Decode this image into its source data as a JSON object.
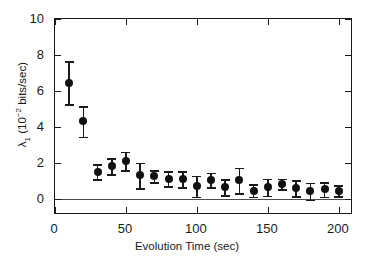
{
  "chart_data": {
    "type": "scatter",
    "title": "",
    "subtitle": "",
    "xlabel": "Evolution Time (sec)",
    "ylabel": "λ₁ (10⁻² bits/sec)",
    "ylabel_parts": {
      "symbol": "λ",
      "subscript": "1",
      "units_prefix": " (10",
      "exponent": "-2",
      "units_suffix": " bits/sec)"
    },
    "xlim": [
      0,
      210
    ],
    "ylim": [
      -0.9,
      10
    ],
    "xticks": [
      0,
      50,
      100,
      150,
      200
    ],
    "xticklabels": [
      "0",
      "50",
      "100",
      "150",
      "200"
    ],
    "yticks": [
      0,
      2,
      4,
      6,
      8,
      10
    ],
    "yticklabels": [
      "0",
      "2",
      "4",
      "6",
      "8",
      "10"
    ],
    "grid": false,
    "legend": null,
    "legend_position": "none",
    "marker": "filled-circle",
    "marker_color": "#111111",
    "errorbar_color": "#1a1a1a",
    "frame_color": "#1a1a1a",
    "background_color": "#ffffff",
    "reference_lines": [
      {
        "axis": "y",
        "value": 0,
        "color": "#4d4d4d",
        "style": "solid"
      }
    ],
    "x": [
      10,
      20,
      30,
      40,
      50,
      60,
      70,
      80,
      90,
      100,
      110,
      120,
      130,
      140,
      150,
      160,
      170,
      180,
      190,
      200
    ],
    "values": [
      6.45,
      4.3,
      1.5,
      1.82,
      2.1,
      1.3,
      1.25,
      1.12,
      1.08,
      0.7,
      1.05,
      0.65,
      1.02,
      0.46,
      0.65,
      0.82,
      0.6,
      0.42,
      0.52,
      0.45
    ],
    "yerr": [
      1.2,
      0.85,
      0.42,
      0.45,
      0.52,
      0.7,
      0.34,
      0.43,
      0.45,
      0.58,
      0.4,
      0.45,
      0.7,
      0.35,
      0.48,
      0.3,
      0.45,
      0.48,
      0.4,
      0.3
    ],
    "points": [
      {
        "x": 10,
        "y": 6.45,
        "err": 1.2
      },
      {
        "x": 20,
        "y": 4.3,
        "err": 0.85
      },
      {
        "x": 30,
        "y": 1.5,
        "err": 0.42
      },
      {
        "x": 40,
        "y": 1.82,
        "err": 0.45
      },
      {
        "x": 50,
        "y": 2.1,
        "err": 0.52
      },
      {
        "x": 60,
        "y": 1.3,
        "err": 0.7
      },
      {
        "x": 70,
        "y": 1.25,
        "err": 0.34
      },
      {
        "x": 80,
        "y": 1.12,
        "err": 0.43
      },
      {
        "x": 90,
        "y": 1.08,
        "err": 0.45
      },
      {
        "x": 100,
        "y": 0.7,
        "err": 0.58
      },
      {
        "x": 110,
        "y": 1.05,
        "err": 0.4
      },
      {
        "x": 120,
        "y": 0.65,
        "err": 0.45
      },
      {
        "x": 130,
        "y": 1.02,
        "err": 0.7
      },
      {
        "x": 140,
        "y": 0.46,
        "err": 0.35
      },
      {
        "x": 150,
        "y": 0.65,
        "err": 0.48
      },
      {
        "x": 160,
        "y": 0.82,
        "err": 0.3
      },
      {
        "x": 170,
        "y": 0.6,
        "err": 0.45
      },
      {
        "x": 180,
        "y": 0.42,
        "err": 0.48
      },
      {
        "x": 190,
        "y": 0.52,
        "err": 0.4
      },
      {
        "x": 200,
        "y": 0.45,
        "err": 0.3
      }
    ]
  }
}
